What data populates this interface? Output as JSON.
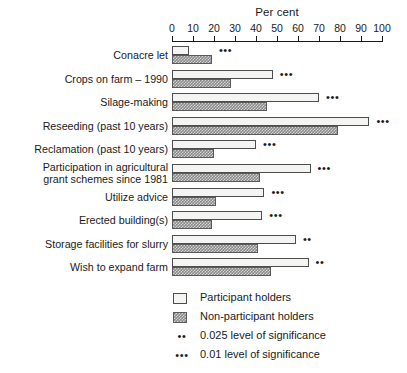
{
  "chart_data": {
    "type": "bar",
    "orientation": "horizontal",
    "title": "Per cent",
    "xlabel": "Per cent",
    "ylabel": "",
    "xlim": [
      0,
      100
    ],
    "xticks": [
      0,
      10,
      20,
      30,
      40,
      50,
      60,
      70,
      80,
      90,
      100
    ],
    "xtick_labels": [
      "0",
      "10",
      "20",
      "30",
      "40",
      "50",
      "60",
      "70",
      "80",
      "90",
      "100"
    ],
    "grid": false,
    "legend_position": "bottom-left",
    "categories": [
      "Conacre let",
      "Crops on farm – 1990",
      "Silage-making",
      "Reseeding (past 10 years)",
      "Reclamation (past 10 years)",
      "Participation in agricultural\ngrant schemes since 1981",
      "Utilize advice",
      "Erected building(s)",
      "Storage facilities for slurry",
      "Wish to expand farm"
    ],
    "series": [
      {
        "name": "Participant holders",
        "values": [
          8,
          48,
          70,
          94,
          40,
          66,
          44,
          43,
          59,
          65
        ]
      },
      {
        "name": "Non-participant holders",
        "values": [
          19,
          28,
          45,
          79,
          20,
          42,
          21,
          19,
          41,
          47
        ]
      }
    ],
    "annotations": [
      {
        "category": "Conacre let",
        "marker": "***"
      },
      {
        "category": "Crops on farm – 1990",
        "marker": "***"
      },
      {
        "category": "Silage-making",
        "marker": "***"
      },
      {
        "category": "Reseeding (past 10 years)",
        "marker": "***"
      },
      {
        "category": "Reclamation (past 10 years)",
        "marker": "***"
      },
      {
        "category": "Participation in agricultural grant schemes since 1981",
        "marker": "***"
      },
      {
        "category": "Utilize advice",
        "marker": "***"
      },
      {
        "category": "Erected building(s)",
        "marker": "***"
      },
      {
        "category": "Storage facilities for slurry",
        "marker": "**"
      },
      {
        "category": "Wish to expand farm",
        "marker": "**"
      }
    ],
    "colors": {
      "participant": "#f4f4f2",
      "non_participant": "#8a8a8a",
      "outline": "#4d4d4d",
      "text": "#1a1a1a"
    }
  },
  "legend": {
    "items": [
      {
        "swatch": "light",
        "label": "Participant holders"
      },
      {
        "swatch": "dark",
        "label": "Non-participant holders"
      },
      {
        "stars": "••",
        "label": "0.025 level of significance"
      },
      {
        "stars": "•••",
        "label": "0.01 level of significance"
      }
    ]
  }
}
